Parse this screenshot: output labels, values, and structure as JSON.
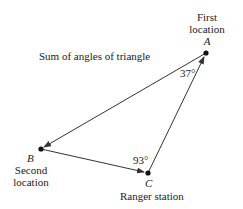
{
  "title": "Sum of angles of triangle",
  "points": {
    "A": {
      "letter": "A",
      "label_line1": "First",
      "label_line2": "location",
      "x": 206,
      "y": 53
    },
    "B": {
      "letter": "B",
      "label_line1": "Second",
      "label_line2": "location",
      "x": 41,
      "y": 149
    },
    "C": {
      "letter": "C",
      "label": "Ranger station",
      "x": 148,
      "y": 173
    }
  },
  "angles": {
    "A": "37°",
    "C": "93°"
  },
  "edges": [
    {
      "from": "A",
      "to": "B",
      "arrow_at": "B"
    },
    {
      "from": "B",
      "to": "C",
      "arrow_at": "C"
    },
    {
      "from": "C",
      "to": "A",
      "arrow_at": "A"
    }
  ],
  "colors": {
    "line": "#333333",
    "text": "#222222"
  }
}
